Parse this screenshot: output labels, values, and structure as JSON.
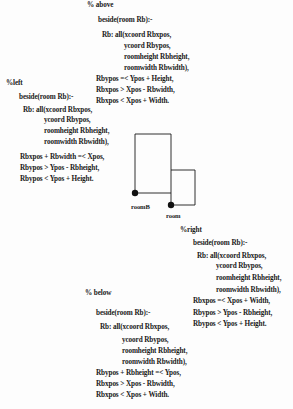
{
  "figure": {
    "sections": {
      "above": {
        "comment": "% above",
        "head": "beside(room Rb):-",
        "lines": [
          "Rb: all(xcoord Rbxpos,",
          "ycoord Rbypos,",
          "roomheight Rbheight,",
          "roomwidth Rbwidth),",
          "Rbypos =< Ypos + Height,",
          "Rbxpos > Xpos - Rbwidth,",
          "Rbxpos < Xpos + Width."
        ]
      },
      "left": {
        "comment": "%left",
        "head": "beside(room Rb):-",
        "lines": [
          "Rb: all(xcoord Rbxpos,",
          "ycoord Rbypos,",
          "roomheight Rbheight,",
          "roomwidth Rbwidth),",
          "Rbxpos + Rbwidth =< Xpos,",
          "Rbypos > Ypos - Rbheight,",
          "Rbypos < Ypos + Height."
        ]
      },
      "right": {
        "comment": "%right",
        "head": "beside(room Rb):-",
        "lines": [
          "Rb: all(xcoord Rbxpos,",
          "ycoord Rbypos,",
          "roomheight Rbheight,",
          "roomwidth Rbwidth),",
          "Rbxpos  =< Xpos + Width,",
          "Rbypos > Ypos - Rbheight,",
          "Rbypos < Ypos + Height."
        ]
      },
      "below": {
        "comment": "% below",
        "head": "beside(room Rb):-",
        "lines": [
          "Rb: all(xcoord Rbxpos,",
          "ycoord Rbypos,",
          "roomheight Rbheight,",
          "roomwidth Rbwidth),",
          "Rbypos + Rbheight =< Ypos,",
          "Rbxpos > Xpos - Rbwidth,",
          "Rbxpos < Xpos + Width."
        ]
      }
    },
    "diagram": {
      "label_roomB": "roomB",
      "label_room": "room",
      "line_color": "#1a1a1a"
    }
  }
}
